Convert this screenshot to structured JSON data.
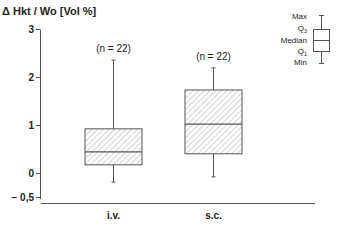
{
  "chart_data": {
    "type": "boxplot",
    "title": "",
    "ylabel": "Δ Hkt / Wo  [Vol %]",
    "xlabel": "",
    "ylim": [
      -0.5,
      3
    ],
    "yticks": [
      {
        "value": 3,
        "label": "3"
      },
      {
        "value": 2,
        "label": "2"
      },
      {
        "value": 1,
        "label": "1"
      },
      {
        "value": 0,
        "label": "0"
      },
      {
        "value": -0.5,
        "label": "− 0,5"
      }
    ],
    "categories": [
      "i.v.",
      "s.c."
    ],
    "series": [
      {
        "name": "i.v.",
        "n_label": "(n = 22)",
        "max": 2.35,
        "q3": 0.92,
        "median": 0.44,
        "q1": 0.17,
        "min": -0.19
      },
      {
        "name": "s.c.",
        "n_label": "(n = 22)",
        "max": 2.19,
        "q3": 1.73,
        "median": 1.02,
        "q1": 0.4,
        "min": -0.08
      }
    ],
    "grid": false,
    "legend": {
      "position": "top-right",
      "labels": {
        "max": "Max",
        "q3": "Q",
        "q3_sub": "3",
        "median": "Median",
        "q1": "Q",
        "q1_sub": "1",
        "min": "Min"
      }
    },
    "box_fill": "hatched",
    "colors": {
      "line": "#555555",
      "hatch": "#9a9a9a",
      "text": "#222222"
    }
  }
}
